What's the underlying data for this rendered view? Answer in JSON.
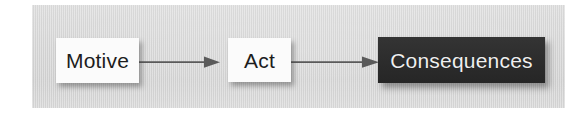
{
  "figure": {
    "type": "flow-diagram",
    "orientation": "left-to-right",
    "background_color": "#ffffff",
    "panel_color": "#d6d6d6"
  },
  "nodes": [
    {
      "id": "motive",
      "label": "Motive",
      "style": "light",
      "fill_color": "#fbfbfb",
      "text_color": "#1d1d1d"
    },
    {
      "id": "act",
      "label": "Act",
      "style": "light",
      "fill_color": "#fbfbfb",
      "text_color": "#1d1d1d"
    },
    {
      "id": "consequences",
      "label": "Consequences",
      "style": "dark",
      "fill_color": "#2f2f2f",
      "text_color": "#efefef"
    }
  ],
  "connectors": [
    {
      "id": "arrow-1",
      "from": "motive",
      "to": "act",
      "label": "",
      "color": "#5a5a5a",
      "head": "solid-triangle"
    },
    {
      "id": "arrow-2",
      "from": "act",
      "to": "consequences",
      "label": "",
      "color": "#5a5a5a",
      "head": "solid-triangle"
    }
  ]
}
